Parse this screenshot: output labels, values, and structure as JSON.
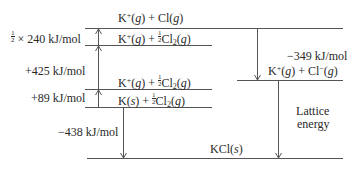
{
  "diagram": {
    "levels": [
      {
        "id": "k-plus-cl-g",
        "parts": [
          "K",
          "+",
          "(",
          "g",
          ") + Cl(",
          "g",
          ")"
        ]
      },
      {
        "id": "k-plus-half-cl2-upper",
        "parts": [
          "K",
          "+",
          "(",
          "g",
          ") + ",
          "1",
          "2",
          "Cl",
          "2",
          "(",
          "g",
          ")"
        ]
      },
      {
        "id": "k-plus-half-cl2-lower",
        "parts": [
          "K",
          "+",
          "(",
          "g",
          ") + ",
          "1",
          "2",
          "Cl",
          "2",
          "(",
          "g",
          ")"
        ]
      },
      {
        "id": "k-s-half-cl2",
        "parts": [
          "K(",
          "s",
          ") + ",
          "1",
          "2",
          "Cl",
          "2",
          "(",
          "g",
          ")"
        ]
      },
      {
        "id": "k-plus-cl-minus-g",
        "parts": [
          "K",
          "+",
          "(",
          "g",
          ") + Cl",
          "−",
          "(",
          "g",
          ")"
        ]
      },
      {
        "id": "kcl-s",
        "parts": [
          "KCl(",
          "s",
          ")"
        ]
      }
    ],
    "energies": {
      "bond_dissociation": {
        "prefix_num": "1",
        "prefix_den": "2",
        "text": " × 240 kJ/mol"
      },
      "ionization": "+425 kJ/mol",
      "sublimation": "+89 kJ/mol",
      "formation": "−438 kJ/mol",
      "electron_affinity": "−349 kJ/mol",
      "lattice_line1": "Lattice",
      "lattice_line2": "energy"
    }
  }
}
